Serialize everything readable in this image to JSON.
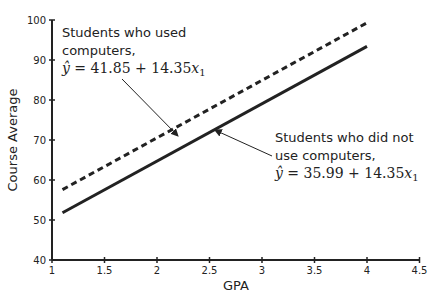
{
  "chart_data": {
    "type": "line",
    "title": "",
    "xlabel": "GPA",
    "ylabel": "Course Average",
    "xlim": [
      1,
      4.5
    ],
    "ylim": [
      40,
      100
    ],
    "x_ticks": [
      "1",
      "1.5",
      "2",
      "2.5",
      "3",
      "3.5",
      "4",
      "4.5"
    ],
    "y_ticks": [
      "40",
      "50",
      "60",
      "70",
      "80",
      "90",
      "100"
    ],
    "grid": false,
    "legend": "none (inline annotations)",
    "series": [
      {
        "name": "Students who used computers",
        "style": "dashed",
        "equation": "ŷ = 41.85 + 14.35x₁",
        "x": [
          1.1,
          4.0
        ],
        "y": [
          57.6,
          99.3
        ]
      },
      {
        "name": "Students who did not use computers",
        "style": "solid",
        "equation": "ŷ = 35.99 + 14.35x₁",
        "x": [
          1.1,
          4.0
        ],
        "y": [
          51.8,
          93.4
        ]
      }
    ],
    "annotations": [
      {
        "lines": [
          "Students who used",
          "computers,"
        ],
        "equation": {
          "lhs": "ŷ",
          "intercept": "41.85",
          "slope": "14.35",
          "var": "x",
          "sub": "1"
        },
        "arrow_to": [
          2.2,
          71
        ]
      },
      {
        "lines": [
          "Students who did not",
          "use computers,"
        ],
        "equation": {
          "lhs": "ŷ",
          "intercept": "35.99",
          "slope": "14.35",
          "var": "x",
          "sub": "1"
        },
        "arrow_to": [
          2.55,
          72.5
        ]
      }
    ]
  }
}
